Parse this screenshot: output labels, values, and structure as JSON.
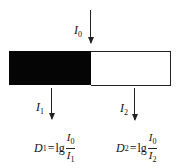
{
  "diagram": {
    "incident": {
      "symbol": "I",
      "subscript": "0"
    },
    "dark_region": {
      "color": "#050505",
      "label": "absorbing (black) half"
    },
    "light_region": {
      "color": "#ffffff",
      "label": "transparent (white) half"
    },
    "transmitted_1": {
      "symbol": "I",
      "subscript": "1"
    },
    "transmitted_2": {
      "symbol": "I",
      "subscript": "2"
    },
    "formula_1": {
      "lhs": "D",
      "lhs_sub": "1",
      "eq": "=",
      "func": "lg",
      "num": "I",
      "num_sub": "0",
      "den": "I",
      "den_sub": "1"
    },
    "formula_2": {
      "lhs": "D",
      "lhs_sub": "2",
      "eq": "=",
      "func": "lg",
      "num": "I",
      "num_sub": "0",
      "den": "I",
      "den_sub": "2"
    }
  }
}
